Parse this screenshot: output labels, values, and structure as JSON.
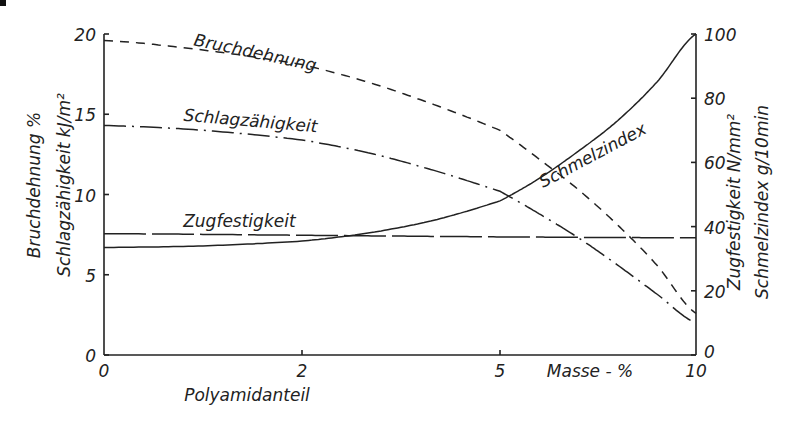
{
  "chart_data": {
    "type": "line",
    "title": "",
    "xlabel": "Polyamidanteil",
    "x_unit_label": "Masse - %",
    "x_ticks": [
      0,
      2,
      5,
      10
    ],
    "xlim": [
      0,
      10
    ],
    "left_axis": {
      "label_lines": [
        "Bruchdehnung %",
        "Schlagzähigkeit kJ/m²"
      ],
      "ticks": [
        0,
        5,
        10,
        15,
        20
      ],
      "ylim": [
        0,
        20
      ]
    },
    "right_axis": {
      "label_lines": [
        "Zugfestigkeit N/mm²",
        "Schmelzindex g/10min"
      ],
      "ticks": [
        0,
        20,
        40,
        60,
        80,
        100
      ],
      "ylim": [
        0,
        100
      ]
    },
    "grid": false,
    "legend": "inline curve labels",
    "series": [
      {
        "name": "Bruchdehnung",
        "axis": "left",
        "style": "dashed",
        "x": [
          0,
          1,
          2,
          3,
          4,
          5,
          6,
          7,
          8,
          9,
          10
        ],
        "values": [
          19.6,
          19.0,
          18.1,
          17.0,
          15.6,
          14.0,
          12.2,
          10.3,
          8.1,
          5.6,
          2.6
        ]
      },
      {
        "name": "Schlagzähigkeit",
        "axis": "left",
        "style": "dash-dot",
        "x": [
          0,
          1,
          2,
          3,
          4,
          5,
          6,
          7,
          8,
          9,
          10
        ],
        "values": [
          14.3,
          14.0,
          13.4,
          12.6,
          11.5,
          10.2,
          8.8,
          7.3,
          5.6,
          3.8,
          2.0
        ]
      },
      {
        "name": "Zugfestigkeit",
        "axis": "right",
        "style": "long-dash",
        "x": [
          0,
          2,
          5,
          10
        ],
        "values": [
          37.8,
          37.3,
          36.8,
          36.5
        ]
      },
      {
        "name": "Schmelzindex",
        "axis": "right",
        "style": "solid",
        "x": [
          0,
          1,
          2,
          3,
          4,
          5,
          6,
          7,
          8,
          9,
          10
        ],
        "values": [
          33.5,
          34.0,
          35.5,
          38.0,
          42.0,
          48.0,
          55.0,
          63.5,
          73.0,
          85.0,
          100.0
        ]
      }
    ],
    "annotations": [
      {
        "text": "Bruchdehnung",
        "x": 0.9,
        "y_left": 19.3,
        "angle": 12
      },
      {
        "text": "Schlagzähigkeit",
        "x": 0.8,
        "y_left": 14.6,
        "angle": 5
      },
      {
        "text": "Zugfestigkeit",
        "x": 0.8,
        "y_left": 8.0,
        "angle": 0
      },
      {
        "text": "Schmelzindex",
        "x": 6.1,
        "y_right": 52,
        "angle": -28
      }
    ]
  }
}
